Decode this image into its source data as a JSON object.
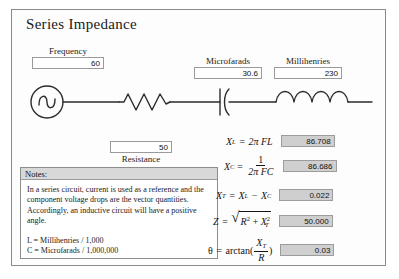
{
  "app": {
    "title": "Series Impedance"
  },
  "inputs": {
    "frequency": {
      "label": "Frequency",
      "value": "60"
    },
    "microfarads": {
      "label": "Microfarads",
      "value": "30.6"
    },
    "millihenries": {
      "label": "Millihenries",
      "value": "230"
    },
    "resistance": {
      "label": "Resistance",
      "value": "50"
    }
  },
  "circuit": {
    "source_icon": "ac-source-icon",
    "resistor_icon": "resistor-icon",
    "capacitor_icon": "capacitor-icon",
    "inductor_icon": "inductor-icon"
  },
  "notes": {
    "header": "Notes:",
    "paragraph": "In a series circuit, current is used as a reference and the component voltage drops are the vector quantities.  Accordingly, an inductive circuit will have a positive angle.",
    "legend": [
      "L = Millihenries / 1,000",
      "C = Microfarads / 1,000,000"
    ]
  },
  "formulas": {
    "xl": {
      "lhs": "X",
      "lhs_sub": "L",
      "eq": "=",
      "rhs": "2π FL",
      "value": "86.708"
    },
    "xc": {
      "lhs": "X",
      "lhs_sub": "C",
      "eq": "=",
      "numerator": "1",
      "denominator": "2π FC",
      "value": "86.686"
    },
    "xt": {
      "lhs": "X",
      "lhs_sub": "T",
      "eq": "=",
      "term1": "X",
      "term1_sub": "L",
      "operator": "−",
      "term2": "X",
      "term2_sub": "C",
      "value": "0.022"
    },
    "z": {
      "lhs": "Z",
      "eq": "=",
      "radicand1": "R",
      "radicand1_sup": "2",
      "plus": "+",
      "radicand2": "X",
      "radicand2_sub": "T",
      "radicand2_sup": "2",
      "value": "50.000"
    },
    "theta": {
      "lhs": "θ",
      "eq": "=",
      "fn": "arctan(",
      "numerator": "X",
      "numerator_sub": "T",
      "denominator": "R",
      "close": ")",
      "value": "0.03"
    }
  },
  "colors": {
    "panel_border": "#8a8a8a",
    "field_border": "#9a9a9a",
    "result_fill": "#cfcfcf",
    "notes_header_fill": "#d8d8d8",
    "wire": "#2b2b2b"
  }
}
